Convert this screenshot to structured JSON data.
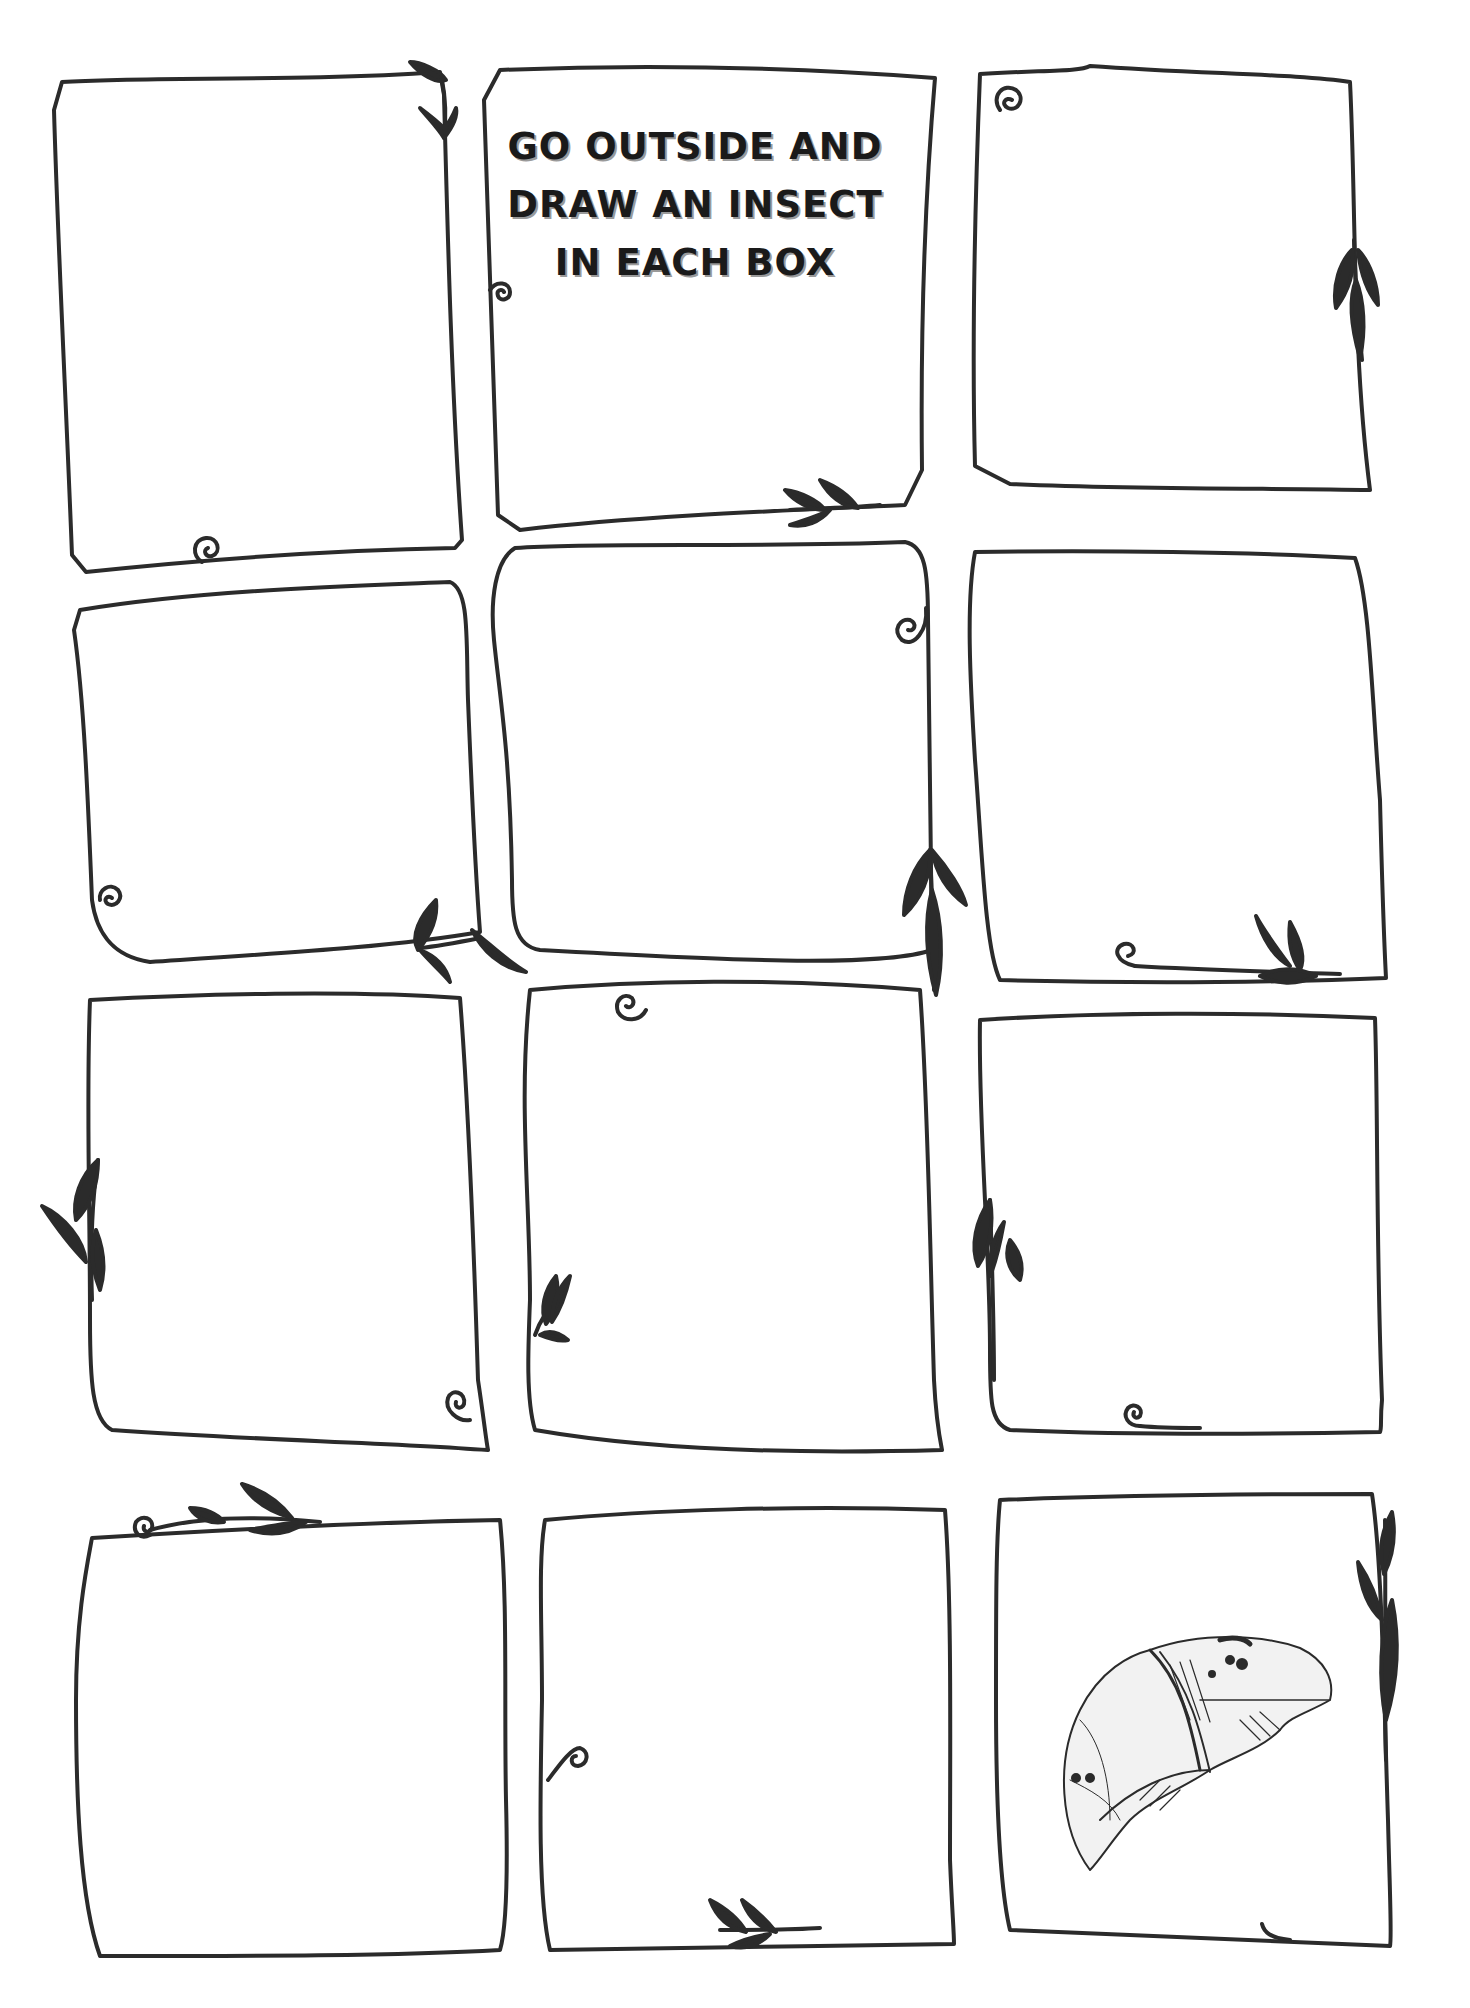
{
  "worksheet": {
    "instruction_lines": [
      "GO OUTSIDE AND",
      "DRAW AN INSECT",
      "IN EACH BOX"
    ],
    "box_count": 12,
    "ink_color": "#2b2b2b",
    "paper_color": "#ffffff",
    "boxes": [
      {
        "id": 1,
        "row": 1,
        "col": 1,
        "content": "empty",
        "decorations": [
          "vine-leaves-top-right",
          "spiral-bottom"
        ]
      },
      {
        "id": 2,
        "row": 1,
        "col": 2,
        "content": "instruction-title",
        "decorations": [
          "spiral-left",
          "vine-leaves-bottom-right"
        ]
      },
      {
        "id": 3,
        "row": 1,
        "col": 3,
        "content": "empty",
        "decorations": [
          "spiral-top-left",
          "vine-leaves-right"
        ]
      },
      {
        "id": 4,
        "row": 2,
        "col": 1,
        "content": "empty",
        "decorations": [
          "spiral-bottom-left",
          "vine-leaves-bottom-right"
        ]
      },
      {
        "id": 5,
        "row": 2,
        "col": 2,
        "content": "empty",
        "decorations": [
          "spiral-top-right",
          "vine-leaves-bottom-right"
        ]
      },
      {
        "id": 6,
        "row": 2,
        "col": 3,
        "content": "empty",
        "decorations": [
          "spiral-bottom",
          "vine-leaves-bottom-right"
        ]
      },
      {
        "id": 7,
        "row": 3,
        "col": 1,
        "content": "empty",
        "decorations": [
          "vine-leaves-left",
          "spiral-bottom-right"
        ]
      },
      {
        "id": 8,
        "row": 3,
        "col": 2,
        "content": "empty",
        "decorations": [
          "spiral-top",
          "vine-leaves-left"
        ]
      },
      {
        "id": 9,
        "row": 3,
        "col": 3,
        "content": "empty",
        "decorations": [
          "vine-leaves-left",
          "spiral-bottom"
        ]
      },
      {
        "id": 10,
        "row": 4,
        "col": 1,
        "content": "empty",
        "decorations": [
          "spiral-vine-top-left"
        ]
      },
      {
        "id": 11,
        "row": 4,
        "col": 2,
        "content": "empty",
        "decorations": [
          "spiral-left",
          "vine-leaves-bottom"
        ]
      },
      {
        "id": 12,
        "row": 4,
        "col": 3,
        "content": "sketch-moth-wing",
        "decorations": [
          "vine-leaves-right"
        ]
      }
    ]
  }
}
